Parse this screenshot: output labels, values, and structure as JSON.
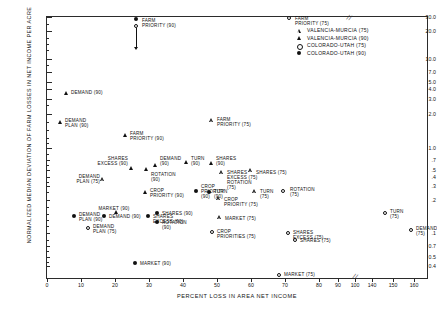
{
  "chart_data": {
    "type": "scatter",
    "title": "",
    "xlabel": "PERCENT LOSS IN AREA NET INCOME",
    "ylabel": "NORMALIZED MEDIAN DEVIATION OF FARM LOSSES IN NET INCOME PER ACRE",
    "xlim": [
      0,
      165
    ],
    "ylim": [
      0.4,
      30
    ],
    "yscale": "log",
    "grid": false,
    "axis_break_after": 100,
    "xticks": [
      0,
      10,
      20,
      30,
      40,
      50,
      60,
      70,
      80,
      90,
      100,
      140,
      150,
      160
    ],
    "xticklabels": [
      "0",
      "10",
      "20",
      "30",
      "40",
      "50",
      "60",
      "70",
      "80",
      "90",
      "100",
      "140",
      "150",
      "160"
    ],
    "yticks": [
      30,
      20,
      10,
      7,
      5,
      4,
      3,
      2,
      1,
      0.7,
      0.5,
      0.4,
      0.3,
      0.2,
      0.1,
      0.07,
      0.05,
      0.04
    ],
    "yticklabels": [
      "30.0",
      "20.0",
      "10.0",
      "7.0",
      "5.0",
      "4.0",
      "3.0",
      "2.0",
      "1.0",
      ".7",
      ".5",
      ".4",
      ".3",
      ".2",
      ".1",
      "0.7",
      "0.5",
      "0.4"
    ],
    "legend_position": "top-right",
    "legend": [
      {
        "marker": "triangle-open",
        "name": "VALENCIA-MURCIA  (75)"
      },
      {
        "marker": "triangle-filled",
        "name": "VALENCIA-MURCIA (90)"
      },
      {
        "marker": "circle-open",
        "name": "COLORADO-UTAH (75)"
      },
      {
        "marker": "circle-filled",
        "name": "COLORADO-UTAH (90)"
      }
    ],
    "annotation_arrow": {
      "label": "FARM PRIORITY (90) off-scale indicator",
      "x": 35,
      "from_y": 26.0,
      "to_y": 18.0
    },
    "points": [
      {
        "label": "FARM\nPRIORITY (90)",
        "marker": "circle-filled",
        "x": 35,
        "y": 26.0,
        "px": 136,
        "py": 19,
        "lx": 142,
        "ly": 18,
        "align": "left"
      },
      {
        "label": "",
        "marker": "circle-open",
        "x": 35,
        "y": 22.0,
        "px": 136,
        "py": 26,
        "lx": 0,
        "ly": 0,
        "align": "none"
      },
      {
        "label": "FARM\nPRIORITY (75)",
        "marker": "circle-open",
        "x": 89,
        "y": 27.0,
        "px": 289,
        "py": 18,
        "lx": 295,
        "ly": 16,
        "align": "left"
      },
      {
        "label": "DEMAND (90)",
        "marker": "triangle-filled",
        "x": 14,
        "y": 4.2,
        "px": 66,
        "py": 93,
        "lx": 71,
        "ly": 90,
        "align": "left"
      },
      {
        "label": "DEMAND\nPLAN (90)",
        "marker": "triangle-filled",
        "x": 12,
        "y": 2.15,
        "px": 60,
        "py": 122,
        "lx": 65,
        "ly": 118,
        "align": "left"
      },
      {
        "label": "FARM\nPRIORITY (90)",
        "marker": "triangle-filled",
        "x": 35,
        "y": 1.62,
        "px": 125,
        "py": 135,
        "lx": 130,
        "ly": 131,
        "align": "left"
      },
      {
        "label": "FARM\nPRIORITY (75)",
        "marker": "triangle-open",
        "x": 63,
        "y": 2.2,
        "px": 212,
        "py": 121,
        "lx": 217,
        "ly": 117,
        "align": "left"
      },
      {
        "label": "SHARES\nEXCESS (90)",
        "marker": "triangle-filled",
        "x": 34,
        "y": 0.9,
        "px": 131,
        "py": 168,
        "lx": 128,
        "ly": 156,
        "align": "right"
      },
      {
        "label": "DEMAND\n(90)",
        "marker": "triangle-filled",
        "x": 41,
        "y": 0.95,
        "px": 155,
        "py": 165,
        "lx": 160,
        "ly": 156,
        "align": "left"
      },
      {
        "label": "ROTATION\n(90)",
        "marker": "triangle-filled",
        "x": 38,
        "y": 0.88,
        "px": 146,
        "py": 169,
        "lx": 151,
        "ly": 172,
        "align": "left"
      },
      {
        "label": "TURN\n(90)",
        "marker": "triangle-filled",
        "x": 52,
        "y": 1.02,
        "px": 186,
        "py": 162,
        "lx": 191,
        "ly": 156,
        "align": "left"
      },
      {
        "label": "SHARES\n(90)",
        "marker": "triangle-filled",
        "x": 59,
        "y": 1.0,
        "px": 211,
        "py": 163,
        "lx": 216,
        "ly": 156,
        "align": "left"
      },
      {
        "label": "SHARES\nEXCESS (75)\nROTATION\n(75)",
        "marker": "triangle-open",
        "x": 64,
        "y": 0.82,
        "px": 222,
        "py": 173,
        "lx": 227,
        "ly": 170,
        "align": "left"
      },
      {
        "label": "SHARES (75)",
        "marker": "triangle-open",
        "x": 71,
        "y": 0.85,
        "px": 251,
        "py": 171,
        "lx": 256,
        "ly": 170,
        "align": "left"
      },
      {
        "label": "DEMAND\nPLAN (75)",
        "marker": "triangle-open",
        "x": 26,
        "y": 0.72,
        "px": 103,
        "py": 180,
        "lx": 100,
        "ly": 174,
        "align": "right"
      },
      {
        "label": "CROP\nPRIORITY (90)",
        "marker": "triangle-filled",
        "x": 38,
        "y": 0.55,
        "px": 145,
        "py": 192,
        "lx": 150,
        "ly": 188,
        "align": "left"
      },
      {
        "label": "CROP\nPRIORITY\n(90)",
        "marker": "circle-filled",
        "x": 55,
        "y": 0.56,
        "px": 196,
        "py": 191,
        "lx": 201,
        "ly": 184,
        "align": "left"
      },
      {
        "label": "TURN\n(90)",
        "marker": "circle-filled",
        "x": 62,
        "y": 0.55,
        "px": 209,
        "py": 192,
        "lx": 214,
        "ly": 189,
        "align": "left"
      },
      {
        "label": "TURN\n(75)",
        "marker": "triangle-open",
        "x": 72,
        "y": 0.55,
        "px": 255,
        "py": 192,
        "lx": 260,
        "ly": 189,
        "align": "left"
      },
      {
        "label": "ROTATION\n(75)",
        "marker": "circle-open",
        "x": 83,
        "y": 0.57,
        "px": 283,
        "py": 191,
        "lx": 290,
        "ly": 187,
        "align": "left"
      },
      {
        "label": "CROP\nPRIORITY (75)",
        "marker": "triangle-open",
        "x": 58,
        "y": 0.47,
        "px": 219,
        "py": 199,
        "lx": 224,
        "ly": 197,
        "align": "left"
      },
      {
        "label": "MARKET (90)",
        "marker": "triangle-filled",
        "x": 30,
        "y": 0.35,
        "px": 116,
        "py": 212,
        "lx": 114,
        "ly": 206,
        "align": "center"
      },
      {
        "label": "DEMAND\nPLAN (90)",
        "marker": "circle-filled",
        "x": 17,
        "y": 0.31,
        "px": 74,
        "py": 216,
        "lx": 79,
        "ly": 212,
        "align": "left"
      },
      {
        "label": "DEMAND (90)",
        "marker": "circle-filled",
        "x": 26,
        "y": 0.31,
        "px": 104,
        "py": 216,
        "lx": 109,
        "ly": 214,
        "align": "left"
      },
      {
        "label": "SHARES (90)",
        "marker": "circle-filled",
        "x": 42,
        "y": 0.34,
        "px": 157,
        "py": 213,
        "lx": 162,
        "ly": 211,
        "align": "left"
      },
      {
        "label": "SHARES\nEXCESS (90)",
        "marker": "circle-filled",
        "x": 39,
        "y": 0.31,
        "px": 148,
        "py": 216,
        "lx": 153,
        "ly": 214,
        "align": "left"
      },
      {
        "label": "ROTATION\n(90)",
        "marker": "circle-filled",
        "x": 42,
        "y": 0.28,
        "px": 157,
        "py": 222,
        "lx": 162,
        "ly": 220,
        "align": "left"
      },
      {
        "label": "MARKET (75)",
        "marker": "triangle-open",
        "x": 60,
        "y": 0.3,
        "px": 220,
        "py": 218,
        "lx": 225,
        "ly": 216,
        "align": "left"
      },
      {
        "label": "DEMAND\nPLAN (75)",
        "marker": "circle-open",
        "x": 21,
        "y": 0.25,
        "px": 88,
        "py": 228,
        "lx": 93,
        "ly": 224,
        "align": "left"
      },
      {
        "label": "CROP\nPRIORITIES (75)",
        "marker": "circle-open",
        "x": 60,
        "y": 0.23,
        "px": 212,
        "py": 232,
        "lx": 217,
        "ly": 229,
        "align": "left"
      },
      {
        "label": "SHARES\nEXCESS (75)",
        "marker": "circle-open",
        "x": 82,
        "y": 0.23,
        "px": 288,
        "py": 233,
        "lx": 293,
        "ly": 230,
        "align": "left"
      },
      {
        "label": "SHARES (75)",
        "marker": "circle-open",
        "x": 85,
        "y": 0.205,
        "px": 295,
        "py": 240,
        "lx": 300,
        "ly": 238,
        "align": "left"
      },
      {
        "label": "TURN\n(75)",
        "marker": "circle-open",
        "x": 152,
        "y": 0.34,
        "px": 385,
        "py": 213,
        "lx": 390,
        "ly": 209,
        "align": "left"
      },
      {
        "label": "DEMAND\n(75)",
        "marker": "circle-open",
        "x": 160,
        "y": 0.25,
        "px": 411,
        "py": 230,
        "lx": 416,
        "ly": 226,
        "align": "left"
      },
      {
        "label": "MARKET (90)",
        "marker": "circle-filled",
        "x": 35,
        "y": 0.135,
        "px": 135,
        "py": 263,
        "lx": 140,
        "ly": 261,
        "align": "left"
      },
      {
        "label": "MARKET (75)",
        "marker": "circle-open",
        "x": 87,
        "y": 0.095,
        "px": 279,
        "py": 275,
        "lx": 284,
        "ly": 272,
        "align": "left"
      }
    ]
  }
}
